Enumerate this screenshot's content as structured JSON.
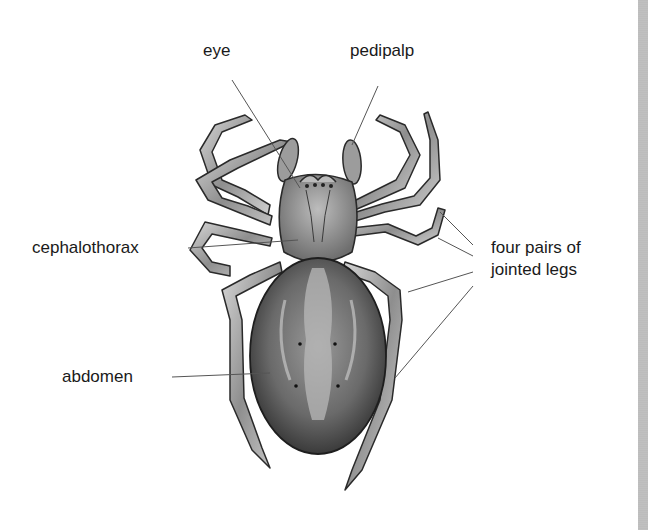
{
  "diagram": {
    "labels": {
      "eye": "eye",
      "pedipalp": "pedipalp",
      "cephalothorax": "cephalothorax",
      "legs_line1": "four pairs of",
      "legs_line2": "jointed legs",
      "abdomen": "abdomen"
    },
    "colors": {
      "background": "#ffffff",
      "text": "#1a1a1a",
      "leader_line": "#555555",
      "body_dark": "#3c3c3c",
      "body_mid": "#8a8a8a",
      "body_light": "#cfcfcf"
    }
  }
}
